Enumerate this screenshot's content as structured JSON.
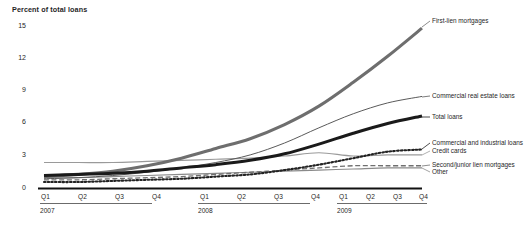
{
  "chart_data": {
    "type": "line",
    "title": "",
    "subtitle": "",
    "ylabel": "Percent of total loans",
    "xlabel": "",
    "ylim": [
      0,
      16
    ],
    "yticks": [
      0,
      3,
      6,
      9,
      12,
      15
    ],
    "ytick_labels": [
      "0",
      "3",
      "6",
      "9",
      "12",
      "15"
    ],
    "grid": false,
    "legend_position": "right-inline",
    "x": [
      "2007 Q1",
      "2007 Q2",
      "2007 Q3",
      "2007 Q4",
      "2008 Q1",
      "2008 Q2",
      "2008 Q3",
      "2008 Q4",
      "2009 Q1",
      "2009 Q2",
      "2009 Q3",
      "2009 Q4"
    ],
    "quarter_labels": [
      "Q1",
      "Q2",
      "Q3",
      "Q4",
      "Q1",
      "Q2",
      "Q3",
      "Q4",
      "Q1",
      "Q2",
      "Q3",
      "Q4"
    ],
    "year_groups": [
      {
        "label": "2007",
        "quarters": [
          "Q1",
          "Q2",
          "Q3",
          "Q4"
        ]
      },
      {
        "label": "2008",
        "quarters": [
          "Q1",
          "Q2",
          "Q3",
          "Q4"
        ]
      },
      {
        "label": "2009",
        "quarters": [
          "Q1",
          "Q2",
          "Q3",
          "Q4"
        ]
      }
    ],
    "series": [
      {
        "name": "First-lien mortgages",
        "style": "solid-thick",
        "color": "#6e6e6e",
        "values": [
          1.1,
          1.3,
          1.6,
          2.1,
          2.8,
          3.7,
          4.6,
          5.9,
          7.6,
          9.8,
          12.2,
          14.8
        ]
      },
      {
        "name": "Commercial real estate loans",
        "style": "solid-thin",
        "color": "#5a5a5a",
        "values": [
          0.9,
          1.0,
          1.2,
          1.5,
          1.9,
          2.4,
          3.1,
          4.2,
          5.6,
          6.9,
          7.9,
          8.5
        ]
      },
      {
        "name": "Total loans",
        "style": "solid-heavy",
        "color": "#1a1a1a",
        "values": [
          1.2,
          1.3,
          1.4,
          1.6,
          1.9,
          2.2,
          2.6,
          3.2,
          4.1,
          5.1,
          6.0,
          6.7
        ]
      },
      {
        "name": "Commercial and industrial loans",
        "style": "dotted",
        "color": "#222222",
        "values": [
          0.6,
          0.6,
          0.7,
          0.8,
          0.9,
          1.1,
          1.3,
          1.7,
          2.2,
          2.8,
          3.4,
          3.6
        ]
      },
      {
        "name": "Credit cards",
        "style": "solid-light",
        "color": "#9a9a9a",
        "values": [
          2.4,
          2.4,
          2.4,
          2.5,
          2.6,
          2.7,
          2.8,
          3.0,
          3.3,
          3.0,
          3.1,
          3.1
        ]
      },
      {
        "name": "Second/junior lien mortgages",
        "style": "dashed",
        "color": "#707070",
        "values": [
          0.8,
          0.8,
          0.9,
          1.0,
          1.1,
          1.3,
          1.5,
          1.7,
          1.9,
          2.1,
          2.1,
          2.1
        ]
      },
      {
        "name": "Other",
        "style": "solid-thin-gray",
        "color": "#8a8a8a",
        "values": [
          1.0,
          1.0,
          1.1,
          1.2,
          1.3,
          1.4,
          1.5,
          1.6,
          1.7,
          1.8,
          1.9,
          1.9
        ]
      }
    ],
    "annotations": [
      {
        "text": "First-lien mortgages",
        "series": "First-lien mortgages"
      },
      {
        "text": "Commercial real estate loans",
        "series": "Commercial real estate loans"
      },
      {
        "text": "Total loans",
        "series": "Total loans"
      },
      {
        "text": "Commercial and industrial loans",
        "series": "Commercial and industrial loans"
      },
      {
        "text": "Credit cards",
        "series": "Credit cards"
      },
      {
        "text": "Second/junior lien mortgages",
        "series": "Second/junior lien mortgages"
      },
      {
        "text": "Other",
        "series": "Other"
      }
    ]
  },
  "axis": {
    "y_title": "Percent of total loans",
    "ytick_labels": [
      "15",
      "12",
      "9",
      "6",
      "3",
      "0"
    ],
    "quarter_labels": [
      "Q1",
      "Q2",
      "Q3",
      "Q4",
      "Q1",
      "Q2",
      "Q3",
      "Q4",
      "Q1",
      "Q2",
      "Q3",
      "Q4"
    ],
    "year_labels": [
      "2007",
      "2008",
      "2009"
    ]
  },
  "legend": {
    "first_lien": "First-lien mortgages",
    "cre": "Commercial real estate loans",
    "total": "Total loans",
    "ci": "Commercial and industrial loans",
    "credit_cards": "Credit cards",
    "second_lien": "Second/junior lien mortgages",
    "other": "Other"
  }
}
